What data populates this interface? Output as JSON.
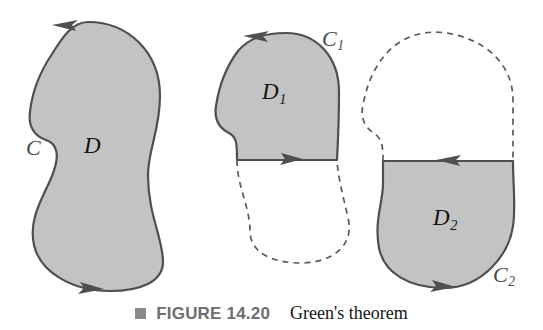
{
  "figure": {
    "caption": {
      "bullet_icon": "filled-square-icon",
      "figure_number": "FIGURE 14.20",
      "title": "Green's theorem"
    },
    "colors": {
      "region_fill": "#c3c3c3",
      "outline": "#4f4f4f",
      "dashed": "#5a5a5a",
      "label": "#131313",
      "curve_label": "#4a4a4a",
      "caption_number": "#6e6e6e",
      "caption_title": "#141414",
      "bullet": "#8a8a8a",
      "background": "#ffffff"
    },
    "panels": [
      {
        "id": "panel-whole-region",
        "region_label": "D",
        "curve_label": "C",
        "shaded": "full",
        "description": "Bean-shaped simply connected region D bounded by positively oriented closed curve C",
        "arrows": [
          {
            "name": "top-arrow",
            "direction": "left",
            "x": 62,
            "y": 25
          },
          {
            "name": "bottom-arrow",
            "direction": "right",
            "x": 88,
            "y": 288
          }
        ]
      },
      {
        "id": "panel-upper-subregion",
        "region_label": "D",
        "region_label_sub": "1",
        "curve_label": "C",
        "curve_label_sub": "1",
        "shaded": "upper-half",
        "description": "Upper subregion D1 shaded, lower boundary dashed, cut line traversed left to right",
        "arrows": [
          {
            "name": "top-arrow",
            "direction": "left",
            "x": 253,
            "y": 34
          },
          {
            "name": "cut-line-arrow",
            "direction": "right",
            "x": 288,
            "y": 160
          }
        ]
      },
      {
        "id": "panel-lower-subregion",
        "region_label": "D",
        "region_label_sub": "2",
        "curve_label": "C",
        "curve_label_sub": "2",
        "shaded": "lower-half",
        "description": "Lower subregion D2 shaded, upper boundary dashed, cut line traversed right to left",
        "arrows": [
          {
            "name": "cut-line-arrow",
            "direction": "left",
            "x": 448,
            "y": 161
          },
          {
            "name": "bottom-arrow",
            "direction": "right",
            "x": 440,
            "y": 287
          }
        ]
      }
    ]
  }
}
